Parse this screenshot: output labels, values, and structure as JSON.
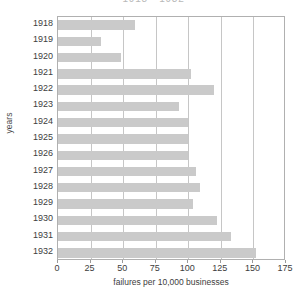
{
  "chart_data": {
    "type": "bar",
    "orientation": "horizontal",
    "title": "1918 - 1932",
    "xlabel": "failures per 10,000 businesses",
    "ylabel": "years",
    "categories": [
      "1918",
      "1919",
      "1920",
      "1921",
      "1922",
      "1923",
      "1924",
      "1925",
      "1926",
      "1927",
      "1928",
      "1929",
      "1930",
      "1931",
      "1932"
    ],
    "values": [
      59,
      33,
      48,
      102,
      120,
      93,
      100,
      100,
      100,
      106,
      109,
      104,
      122,
      133,
      152
    ],
    "xlim": [
      0,
      175
    ],
    "xticks": [
      "0",
      "25",
      "50",
      "75",
      "100",
      "125",
      "150",
      "175"
    ],
    "xtick_values": [
      0,
      25,
      50,
      75,
      100,
      125,
      150,
      175
    ],
    "grid": "vertical",
    "legend": "none",
    "bar_color": "#cacaca",
    "axis_color": "#b0b0b0",
    "grid_color": "#c6c6c6",
    "text_color": "#3d3d3d"
  }
}
